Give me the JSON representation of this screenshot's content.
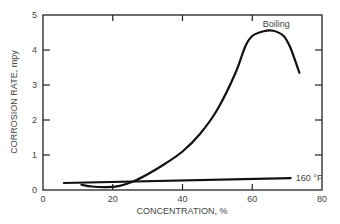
{
  "chart_data": {
    "type": "line",
    "title": "",
    "xlabel": "CONCENTRATION, %",
    "ylabel": "CORROSION RATE, mpy",
    "xlim": [
      0,
      80
    ],
    "ylim": [
      0,
      5
    ],
    "xticks": [
      0,
      20,
      40,
      60,
      80
    ],
    "yticks": [
      0,
      1,
      2,
      3,
      4,
      5
    ],
    "grid": false,
    "legend": "inline labels",
    "series": [
      {
        "name": "Boiling",
        "x": [
          11,
          14,
          18,
          22,
          26,
          30,
          35,
          40,
          45,
          50,
          55,
          58,
          60,
          63,
          66,
          69,
          71,
          73.5
        ],
        "y": [
          0.15,
          0.1,
          0.08,
          0.12,
          0.25,
          0.45,
          0.75,
          1.1,
          1.6,
          2.3,
          3.3,
          4.1,
          4.4,
          4.53,
          4.55,
          4.4,
          4.05,
          3.35
        ]
      },
      {
        "name": "160 °F",
        "x": [
          6,
          71
        ],
        "y": [
          0.2,
          0.34
        ]
      }
    ],
    "annotations": [
      {
        "text": "Boiling",
        "x": 63,
        "y": 4.75
      },
      {
        "text": "160 °F",
        "x": 72.5,
        "y": 0.34
      }
    ]
  }
}
